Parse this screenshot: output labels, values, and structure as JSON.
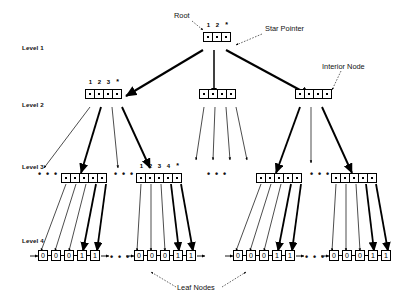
{
  "figure": {
    "background": "#ffffff",
    "ink": "#000000"
  },
  "levels": [
    {
      "label": "Level 1"
    },
    {
      "label": "Level 2"
    },
    {
      "label": "Level 3"
    },
    {
      "label": "Level 4"
    }
  ],
  "annotations": {
    "root": "Root",
    "star_pointer": "Star Pointer",
    "interior_node": "Interior Node",
    "leaf_nodes": "Leaf Nodes"
  },
  "keys": {
    "root_keys": [
      "1",
      "2",
      "*"
    ],
    "level2_keys": [
      "1",
      "2",
      "3",
      "*"
    ],
    "level3_keys": [
      "1",
      "2",
      "3",
      "4",
      "*"
    ]
  },
  "nodes": {
    "root": {
      "cells": 3,
      "keys_shown": true
    },
    "level2": [
      {
        "cells": 4,
        "keys_shown": true
      },
      {
        "cells": 4,
        "keys_shown": false
      },
      {
        "cells": 4,
        "keys_shown": false
      }
    ],
    "level3": [
      {
        "cells": 5,
        "keys_shown": false
      },
      {
        "cells": 5,
        "keys_shown": true
      },
      {
        "cells": 5,
        "keys_shown": false
      },
      {
        "cells": 5,
        "keys_shown": false
      }
    ]
  },
  "leaves": {
    "values": [
      "0",
      "0",
      "0",
      "1",
      "1"
    ],
    "groups": 4
  },
  "ellipses": {
    "glyph": "• • •"
  }
}
